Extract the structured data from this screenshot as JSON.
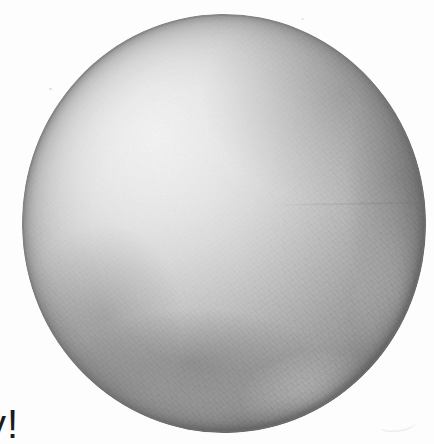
{
  "page": {
    "background_color": "#fdfdfd"
  },
  "artwork": {
    "subject": "graphite pencil drawing of a shaded sphere",
    "technique": "crosshatched pencil shading on white paper",
    "light_direction": "upper left",
    "colors": {
      "highlight": "#fbfbfb",
      "light_midtone": "#d6d6d6",
      "midtone": "#a8a8a8",
      "shadow": "#7d7d7d",
      "core_shadow": "#666666",
      "reflected_light": "#cccccc",
      "outline": "#6e6e6e"
    }
  },
  "caption": {
    "fragment": "y!"
  }
}
